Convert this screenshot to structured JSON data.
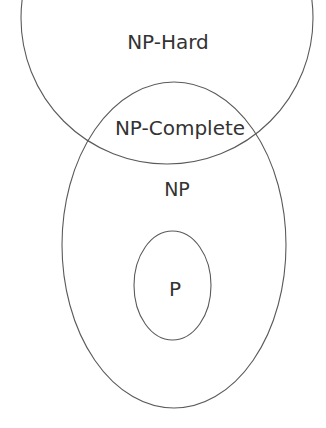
{
  "diagram": {
    "type": "euler-diagram",
    "colors": {
      "background": "#ffffff",
      "stroke": "#5a5a5a",
      "text": "#333333"
    },
    "sets": [
      {
        "id": "np-hard",
        "label": "NP-Hard",
        "shape": "circle",
        "cx": 167,
        "cy": 18,
        "r": 146
      },
      {
        "id": "np",
        "label": "NP",
        "shape": "ellipse",
        "cx": 174,
        "cy": 245,
        "rx": 112,
        "ry": 163
      },
      {
        "id": "p",
        "label": "P",
        "shape": "ellipse",
        "cx": 172.5,
        "cy": 285.5,
        "rx": 38.5,
        "ry": 54.5
      }
    ],
    "labels": {
      "np_hard": "NP-Hard",
      "np_complete": "NP-Complete",
      "np": "NP",
      "p": "P"
    },
    "relationships": [
      "P is a subset of NP",
      "NP-Complete is the intersection of NP and NP-Hard"
    ]
  }
}
